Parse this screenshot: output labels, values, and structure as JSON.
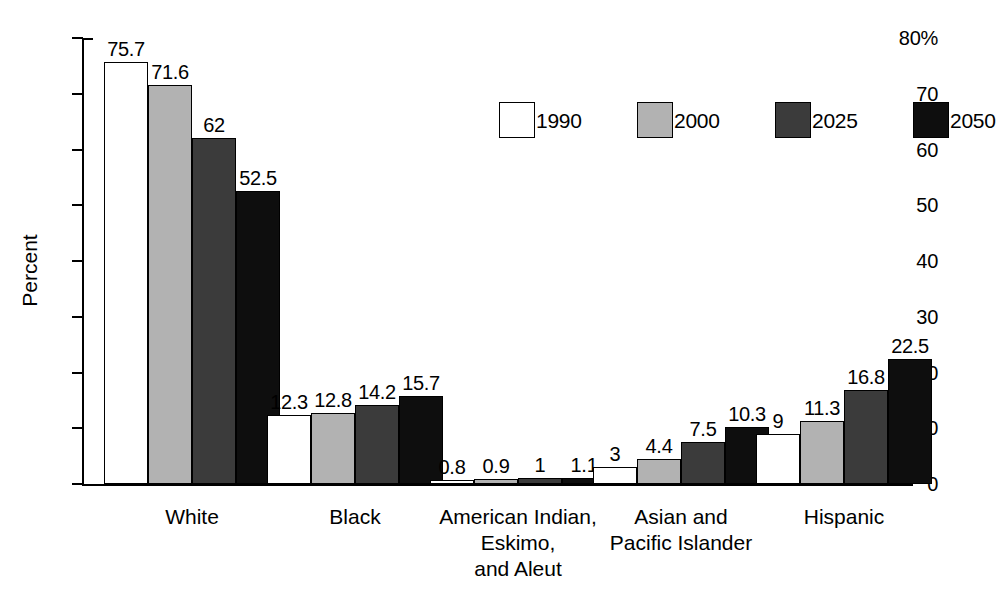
{
  "chart_data": {
    "type": "bar",
    "title": "",
    "xlabel": "",
    "ylabel": "Percent",
    "ylim": [
      0,
      80
    ],
    "yticks": [
      0,
      10,
      20,
      30,
      40,
      50,
      60,
      70,
      80
    ],
    "ytick_labels": [
      "0",
      "10",
      "20",
      "30",
      "40",
      "50",
      "60",
      "70",
      "80%"
    ],
    "grid": false,
    "legend_position": "top-right",
    "categories": [
      "White",
      "Black",
      "American Indian, Eskimo, and Aleut",
      "Asian and Pacific Islander",
      "Hispanic"
    ],
    "category_label_lines": [
      [
        "White"
      ],
      [
        "Black"
      ],
      [
        "American Indian,",
        "Eskimo,",
        "and Aleut"
      ],
      [
        "Asian and",
        "Pacific Islander"
      ],
      [
        "Hispanic"
      ]
    ],
    "series": [
      {
        "name": "1990",
        "color": "#ffffff",
        "values": [
          75.7,
          12.3,
          0.8,
          3,
          9
        ],
        "labels": [
          "75.7",
          "12.3",
          "0.8",
          "3",
          "9"
        ]
      },
      {
        "name": "2000",
        "color": "#b2b2b2",
        "values": [
          71.6,
          12.8,
          0.9,
          4.4,
          11.3
        ],
        "labels": [
          "71.6",
          "12.8",
          "0.9",
          "4.4",
          "11.3"
        ]
      },
      {
        "name": "2025",
        "color": "#3b3b3b",
        "values": [
          62,
          14.2,
          1,
          7.5,
          16.8
        ],
        "labels": [
          "62",
          "14.2",
          "1",
          "7.5",
          "16.8"
        ]
      },
      {
        "name": "2050",
        "color": "#0e0e0e",
        "values": [
          52.5,
          15.7,
          1.1,
          10.3,
          22.5
        ],
        "labels": [
          "52.5",
          "15.7",
          "1.1",
          "10.3",
          "22.5"
        ]
      }
    ]
  },
  "legend": {
    "items": [
      {
        "label": "1990",
        "swatch": "white-swatch"
      },
      {
        "label": "2000",
        "swatch": "light-gray-swatch"
      },
      {
        "label": "2025",
        "swatch": "dark-gray-swatch"
      },
      {
        "label": "2050",
        "swatch": "black-swatch"
      }
    ]
  }
}
